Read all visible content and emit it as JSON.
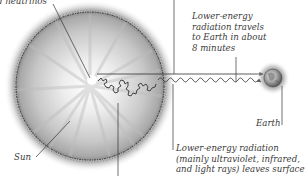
{
  "diagram": {
    "title": "",
    "labels": {
      "neutrinos": "d neutrinos",
      "travel": [
        "Lower-energy",
        "radiation travels",
        "to Earth in about",
        "8 minutes"
      ],
      "earth": "Earth",
      "sun": "Sun",
      "leaves_surface": [
        "Lower-energy radiation",
        "(mainly ultraviolet, infrared,",
        "and light rays) leaves surface"
      ]
    },
    "elements": {
      "sun": "sun-disc",
      "earth": "earth-globe",
      "straight_arrow": "neutrino-path-arrow",
      "wavy_arrow": "radiation-wave-arrow",
      "random_walk": "photon-random-walk"
    },
    "colors": {
      "ink": "#3a3a3a",
      "sun_core": "#ffffff",
      "sun_edge": "#8a8a8a",
      "sun_rim": "#4a4a4a",
      "earth": "#9a9a9a",
      "background": "#ffffff"
    }
  }
}
